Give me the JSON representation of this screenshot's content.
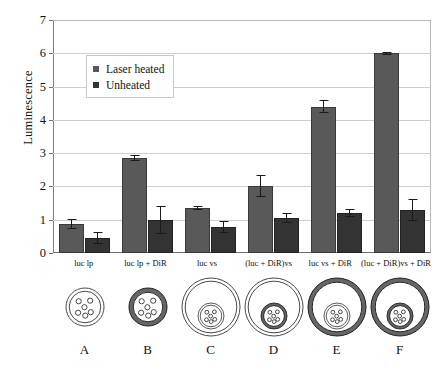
{
  "chart_data": {
    "type": "bar",
    "title": "",
    "xlabel": "",
    "ylabel": "Luminescence",
    "ylim": [
      0,
      7
    ],
    "yticks": [
      0,
      1,
      2,
      3,
      4,
      5,
      6,
      7
    ],
    "grid": true,
    "legend_position": "upper-left-inside",
    "categories": [
      "luc lp",
      "luc lp + DiR",
      "luc vs",
      "(luc + DiR)vs",
      "luc vs + DiR",
      "(luc + DiR)vs + DiR"
    ],
    "panel_letters": [
      "A",
      "B",
      "C",
      "D",
      "E",
      "F"
    ],
    "series": [
      {
        "name": "Laser heated",
        "color": "#595959",
        "values": [
          0.87,
          2.85,
          1.35,
          2.0,
          4.4,
          6.0
        ],
        "errors": [
          0.16,
          0.09,
          0.06,
          0.33,
          0.2,
          0.05
        ]
      },
      {
        "name": "Unheated",
        "color": "#333333",
        "values": [
          0.45,
          0.98,
          0.78,
          1.05,
          1.2,
          1.3
        ],
        "errors": [
          0.17,
          0.42,
          0.18,
          0.14,
          0.12,
          0.33
        ]
      }
    ]
  },
  "diagrams": [
    {
      "letter": "A",
      "name": "liposome-plain",
      "outer_shell": "thin",
      "outer_radius": 19,
      "has_inner_vesicle": false,
      "payload_dots": 6
    },
    {
      "letter": "B",
      "name": "liposome-dir-shell",
      "outer_shell": "thick",
      "outer_radius": 19,
      "has_inner_vesicle": false,
      "payload_dots": 6
    },
    {
      "letter": "C",
      "name": "vesosome-plain",
      "outer_shell": "thin",
      "outer_radius": 29,
      "has_inner_vesicle": true,
      "inner_shell": "thin",
      "inner_radius": 13,
      "payload_dots": 6
    },
    {
      "letter": "D",
      "name": "vesosome-inner-dir",
      "outer_shell": "thin",
      "outer_radius": 29,
      "has_inner_vesicle": true,
      "inner_shell": "thick",
      "inner_radius": 13,
      "payload_dots": 6
    },
    {
      "letter": "E",
      "name": "vesosome-outer-dir",
      "outer_shell": "thick",
      "outer_radius": 29,
      "has_inner_vesicle": true,
      "inner_shell": "thin",
      "inner_radius": 13,
      "payload_dots": 6
    },
    {
      "letter": "F",
      "name": "vesosome-both-dir",
      "outer_shell": "thick",
      "outer_radius": 29,
      "has_inner_vesicle": true,
      "inner_shell": "thick",
      "inner_radius": 13,
      "payload_dots": 6
    }
  ],
  "legend": {
    "items": [
      {
        "label": "Laser heated",
        "swatch": "heated"
      },
      {
        "label": "Unheated",
        "swatch": "unheated"
      }
    ]
  }
}
